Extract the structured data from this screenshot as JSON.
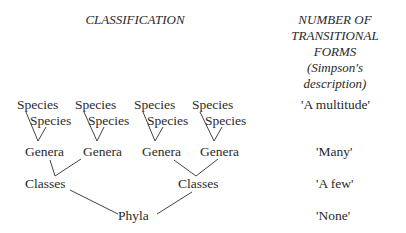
{
  "headers": {
    "classification": "CLASSIFICATION",
    "transitional": [
      "NUMBER OF",
      "TRANSITIONAL",
      "FORMS",
      "(Simpson's",
      "description)"
    ]
  },
  "tree": {
    "species_top": [
      "Species",
      "Species",
      "Species",
      "Species"
    ],
    "species_sub": [
      "Species",
      "Species",
      "Species",
      "Species"
    ],
    "genera": [
      "Genera",
      "Genera",
      "Genera",
      "Genera"
    ],
    "classes": [
      "Classes",
      "Classes"
    ],
    "phyla": [
      "Phyla"
    ]
  },
  "transitional_forms": {
    "species": "'A multitude'",
    "genera": "'Many'",
    "classes": "'A few'",
    "phyla": "'None'"
  }
}
